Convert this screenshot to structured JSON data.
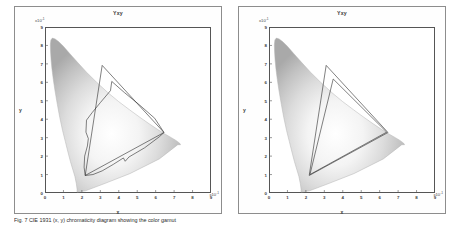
{
  "figure": {
    "caption": "Fig. 7   CIE 1931 (x, y) chromaticity diagram showing the color gamut"
  },
  "panels": [
    {
      "id": "left",
      "title": "Yxy",
      "y_multiplier": "x10",
      "y_exponent": "-1",
      "x_multiplier": "x10",
      "x_exponent": "-1",
      "axis_title_y": "y",
      "axis_title_x": "x",
      "chart_data": {
        "type": "scatter",
        "title": "Yxy",
        "xlabel": "x",
        "ylabel": "y",
        "xlim": [
          0,
          9
        ],
        "ylim": [
          0,
          9
        ],
        "xticks": [
          0,
          1,
          2,
          3,
          4,
          5,
          6,
          7,
          8,
          9
        ],
        "yticks": [
          0,
          1,
          2,
          3,
          4,
          5,
          6,
          7,
          8,
          9
        ],
        "x_tick_scale": "x10^-1",
        "y_tick_scale": "x10^-1",
        "grid": false,
        "legend": "none",
        "annotations": [
          "CIE 1931 spectral locus horseshoe filled with chromaticity gradient",
          "Reference RGB gamut triangle overlay",
          "Measured device gamut, irregular polygon overlay"
        ],
        "series": [
          {
            "name": "spectral-locus",
            "kind": "closed-curve",
            "x": [
              1.74,
              1.74,
              1.7,
              1.62,
              1.5,
              1.38,
              1.25,
              1.1,
              0.95,
              0.8,
              0.67,
              0.55,
              0.45,
              0.38,
              0.33,
              0.3,
              0.29,
              0.32,
              0.4,
              0.55,
              0.75,
              1.0,
              1.35,
              1.75,
              2.25,
              2.8,
              3.4,
              4.0,
              4.6,
              5.15,
              5.65,
              6.1,
              6.5,
              6.85,
              7.1,
              7.3,
              7.35,
              7.2,
              6.2,
              4.6,
              3.2,
              2.2,
              1.74
            ],
            "y": [
              0.05,
              0.2,
              0.5,
              0.9,
              1.3,
              1.7,
              2.2,
              2.8,
              3.4,
              4.1,
              4.8,
              5.5,
              6.15,
              6.7,
              7.2,
              7.7,
              8.05,
              8.3,
              8.4,
              8.35,
              8.2,
              7.95,
              7.55,
              7.1,
              6.55,
              6.0,
              5.45,
              4.95,
              4.5,
              4.1,
              3.75,
              3.45,
              3.2,
              3.0,
              2.85,
              2.7,
              2.62,
              2.62,
              1.85,
              1.05,
              0.5,
              0.12,
              0.05
            ]
          },
          {
            "name": "reference-gamut-triangle",
            "kind": "polygon",
            "x": [
              2.18,
              3.1,
              6.45
            ],
            "y": [
              0.95,
              6.92,
              3.28
            ]
          },
          {
            "name": "measured-gamut-polygon",
            "kind": "polygon",
            "x": [
              2.18,
              2.12,
              2.15,
              2.3,
              2.35,
              2.22,
              2.25,
              2.55,
              3.0,
              3.55,
              3.62,
              4.3,
              5.15,
              5.95,
              6.45,
              6.2,
              5.4,
              4.55,
              4.35,
              4.25,
              3.7,
              3.1,
              2.6
            ],
            "y": [
              0.95,
              1.4,
              2.0,
              2.55,
              2.95,
              3.3,
              3.95,
              4.35,
              4.9,
              5.55,
              6.05,
              5.45,
              4.75,
              4.05,
              3.28,
              3.05,
              2.45,
              1.95,
              1.72,
              1.9,
              1.55,
              1.2,
              1.0
            ]
          }
        ]
      },
      "ytick_labels": [
        "9",
        "8",
        "7",
        "6",
        "5",
        "4",
        "3",
        "2",
        "1",
        "0"
      ],
      "xtick_labels": [
        "0",
        "1",
        "2",
        "3",
        "4",
        "5",
        "6",
        "7",
        "8",
        "9"
      ]
    },
    {
      "id": "right",
      "title": "Yxy",
      "y_multiplier": "x10",
      "y_exponent": "-1",
      "x_multiplier": "x10",
      "x_exponent": "-1",
      "axis_title_y": "y",
      "axis_title_x": "x",
      "chart_data": {
        "type": "scatter",
        "title": "Yxy",
        "xlabel": "x",
        "ylabel": "y",
        "xlim": [
          0,
          9
        ],
        "ylim": [
          0,
          9
        ],
        "xticks": [
          0,
          1,
          2,
          3,
          4,
          5,
          6,
          7,
          8,
          9
        ],
        "yticks": [
          0,
          1,
          2,
          3,
          4,
          5,
          6,
          7,
          8,
          9
        ],
        "x_tick_scale": "x10^-1",
        "y_tick_scale": "x10^-1",
        "grid": false,
        "legend": "none",
        "annotations": [
          "CIE 1931 spectral locus horseshoe filled with chromaticity gradient",
          "Reference RGB gamut triangle overlay",
          "Second gamut triangle overlay, nearly coincident"
        ],
        "series": [
          {
            "name": "spectral-locus",
            "kind": "closed-curve",
            "x": [
              1.74,
              1.74,
              1.7,
              1.62,
              1.5,
              1.38,
              1.25,
              1.1,
              0.95,
              0.8,
              0.67,
              0.55,
              0.45,
              0.38,
              0.33,
              0.3,
              0.29,
              0.32,
              0.4,
              0.55,
              0.75,
              1.0,
              1.35,
              1.75,
              2.25,
              2.8,
              3.4,
              4.0,
              4.6,
              5.15,
              5.65,
              6.1,
              6.5,
              6.85,
              7.1,
              7.3,
              7.35,
              7.2,
              6.2,
              4.6,
              3.2,
              2.2,
              1.74
            ],
            "y": [
              0.05,
              0.2,
              0.5,
              0.9,
              1.3,
              1.7,
              2.2,
              2.8,
              3.4,
              4.1,
              4.8,
              5.5,
              6.15,
              6.7,
              7.2,
              7.7,
              8.05,
              8.3,
              8.4,
              8.35,
              8.2,
              7.95,
              7.55,
              7.1,
              6.55,
              6.0,
              5.45,
              4.95,
              4.5,
              4.1,
              3.75,
              3.45,
              3.2,
              3.0,
              2.85,
              2.7,
              2.62,
              2.62,
              1.85,
              1.05,
              0.5,
              0.12,
              0.05
            ]
          },
          {
            "name": "reference-gamut-triangle",
            "kind": "polygon",
            "x": [
              2.18,
              3.1,
              6.45
            ],
            "y": [
              0.95,
              6.92,
              3.28
            ]
          },
          {
            "name": "measured-gamut-triangle",
            "kind": "polygon",
            "x": [
              2.22,
              3.48,
              6.38
            ],
            "y": [
              1.0,
              6.18,
              3.3
            ]
          }
        ]
      },
      "ytick_labels": [
        "9",
        "8",
        "7",
        "6",
        "5",
        "4",
        "3",
        "2",
        "1",
        "0"
      ],
      "xtick_labels": [
        "0",
        "1",
        "2",
        "3",
        "4",
        "5",
        "6",
        "7",
        "8",
        "9"
      ]
    }
  ],
  "colors": {
    "frame": "#8d8d8d",
    "axis": "#555555",
    "text": "#3a3a3a",
    "polygon": "#2b2b2b",
    "background": "#ffffff"
  }
}
